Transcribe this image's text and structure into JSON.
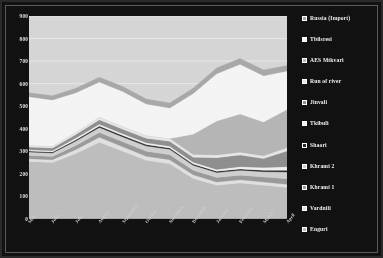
{
  "colors": {
    "background": "#111111",
    "frame_border": "#5a5a5a",
    "plot_background": "#d6d6d6",
    "gridline": "#f0f0f0",
    "axis_text": "#e8e8e8",
    "legend_text": "#f2f2f2"
  },
  "legend": {
    "position": "right",
    "items": [
      {
        "label": "Russia (Import)",
        "swatch": "#a8a8a8"
      },
      {
        "label": "Tbilsresi",
        "swatch": "#f4f4f4"
      },
      {
        "label": "AES Mtkvari",
        "swatch": "#b5b5b5"
      },
      {
        "label": "Run of river",
        "swatch": "#e6e6e6"
      },
      {
        "label": "Jinvali",
        "swatch": "#8f8f8f"
      },
      {
        "label": "Tkibuli",
        "swatch": "#f0f0f0"
      },
      {
        "label": "Shaori",
        "swatch": "#2c2c2c"
      },
      {
        "label": "Khrami 2",
        "swatch": "#cfcfcf"
      },
      {
        "label": "Khrami 1",
        "swatch": "#9a9a9a"
      },
      {
        "label": "Vardnili",
        "swatch": "#e0e0e0"
      },
      {
        "label": "Enguri",
        "swatch": "#bdbdbd"
      }
    ]
  },
  "chart_data": {
    "type": "area",
    "stacked": true,
    "title": "",
    "subtitle": "",
    "xlabel": "",
    "ylabel": "",
    "ylim": [
      0,
      900
    ],
    "yticks": [
      0,
      100,
      200,
      300,
      400,
      500,
      600,
      700,
      800,
      900
    ],
    "ytick_labels": [
      "0",
      "100",
      "200",
      "300",
      "400",
      "500",
      "600",
      "700",
      "800",
      "900"
    ],
    "grid": true,
    "legend_position": "right",
    "categories": [
      "May",
      "June",
      "July",
      "August",
      "September",
      "October",
      "November",
      "December",
      "January",
      "February",
      "March",
      "April"
    ],
    "stack_order_bottom_to_top": [
      "Enguri",
      "Vardnili",
      "Khrami 1",
      "Khrami 2",
      "Shaori",
      "Tkibuli",
      "Jinvali",
      "Run of river",
      "AES Mtkvari",
      "Tbilsresi",
      "Russia (Import)"
    ],
    "series": [
      {
        "name": "Enguri",
        "color": "#bdbdbd",
        "values": [
          255,
          250,
          290,
          340,
          300,
          260,
          245,
          180,
          150,
          160,
          150,
          140
        ]
      },
      {
        "name": "Vardnili",
        "color": "#e0e0e0",
        "values": [
          12,
          13,
          18,
          22,
          20,
          18,
          18,
          16,
          14,
          14,
          14,
          14
        ]
      },
      {
        "name": "Khrami 1",
        "color": "#9a9a9a",
        "values": [
          14,
          14,
          18,
          22,
          22,
          22,
          22,
          20,
          20,
          20,
          22,
          24
        ]
      },
      {
        "name": "Khrami 2",
        "color": "#cfcfcf",
        "values": [
          16,
          16,
          20,
          22,
          22,
          24,
          24,
          22,
          22,
          22,
          24,
          30
        ]
      },
      {
        "name": "Shaori",
        "color": "#2c2c2c",
        "values": [
          4,
          4,
          5,
          6,
          6,
          6,
          6,
          6,
          6,
          6,
          6,
          8
        ]
      },
      {
        "name": "Tkibuli",
        "color": "#f0f0f0",
        "values": [
          6,
          6,
          8,
          8,
          8,
          8,
          8,
          8,
          8,
          10,
          12,
          16
        ]
      },
      {
        "name": "Jinvali",
        "color": "#8f8f8f",
        "values": [
          12,
          12,
          16,
          20,
          20,
          20,
          22,
          22,
          52,
          52,
          40,
          70
        ]
      },
      {
        "name": "Run of river",
        "color": "#e6e6e6",
        "values": [
          8,
          8,
          10,
          12,
          12,
          12,
          12,
          12,
          12,
          12,
          12,
          14
        ]
      },
      {
        "name": "AES Mtkvari",
        "color": "#b5b5b5",
        "values": [
          0,
          0,
          0,
          0,
          0,
          0,
          0,
          90,
          150,
          170,
          150,
          170
        ]
      },
      {
        "name": "Tbilsresi",
        "color": "#f4f4f4",
        "values": [
          215,
          205,
          175,
          155,
          155,
          140,
          135,
          180,
          210,
          220,
          205,
          170
        ]
      },
      {
        "name": "Russia (Import)",
        "color": "#a8a8a8",
        "values": [
          18,
          18,
          20,
          22,
          22,
          22,
          22,
          24,
          26,
          26,
          26,
          24
        ]
      }
    ]
  }
}
